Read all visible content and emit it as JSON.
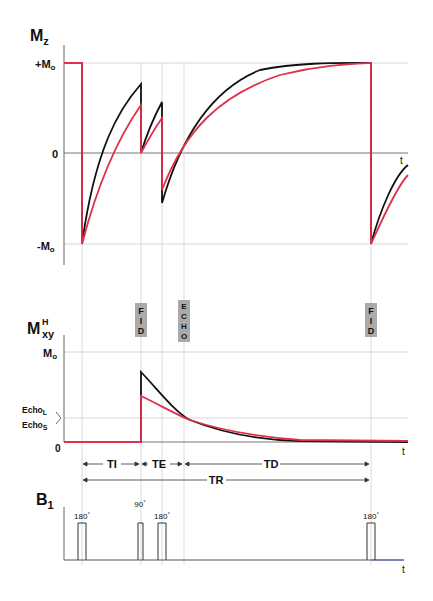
{
  "colors": {
    "long_t1": "#111111",
    "short_t1": "#e0304a",
    "grid": "#cccccc",
    "axis": "#555555",
    "tag_bg": "#aaaaaa"
  },
  "mz_panel": {
    "axis_label": "M",
    "axis_sub": "z",
    "ticks": {
      "plus": "+M",
      "plus_sub": "o",
      "zero": "0",
      "minus": "-M",
      "minus_sub": "o"
    },
    "t_label": "t"
  },
  "mxy_panel": {
    "axis_label": "M",
    "axis_sup": "H",
    "axis_sub": "xy",
    "ticks": {
      "m0": "M",
      "m0_sub": "o",
      "zero": "0"
    },
    "echo_long": "Echo",
    "echo_long_sub": "L",
    "echo_short": "Echo",
    "echo_short_sub": "S",
    "t_label": "t",
    "tags": [
      {
        "text": [
          "F",
          "I",
          "D"
        ],
        "x": 141
      },
      {
        "text": [
          "E",
          "C",
          "H",
          "O"
        ],
        "x": 184
      },
      {
        "text": [
          "F",
          "I",
          "D"
        ],
        "x": 371
      }
    ]
  },
  "intervals": {
    "ti": "TI",
    "te": "TE",
    "td": "TD",
    "tr": "TR"
  },
  "b1_panel": {
    "axis_label": "B",
    "axis_sub": "1",
    "t_label": "t",
    "pulses": [
      {
        "label": "180",
        "x": 82
      },
      {
        "label": "90",
        "x": 141
      },
      {
        "label": "180",
        "x": 162
      },
      {
        "label": "180",
        "x": 371
      }
    ],
    "degree": "°"
  }
}
